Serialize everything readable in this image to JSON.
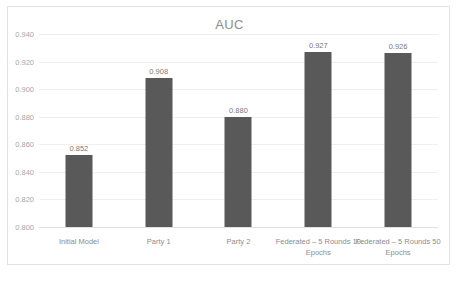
{
  "chart_data": {
    "type": "bar",
    "title": "AUC",
    "xlabel": "",
    "ylabel": "",
    "ylim": [
      0.8,
      0.94
    ],
    "ytick_step": 0.02,
    "yticks": [
      "0.940",
      "0.920",
      "0.900",
      "0.880",
      "0.860",
      "0.840",
      "0.820",
      "0.800"
    ],
    "ytick_values": [
      0.94,
      0.92,
      0.9,
      0.88,
      0.86,
      0.84,
      0.82,
      0.8
    ],
    "grid": true,
    "legend": false,
    "bar_color": "#595959",
    "categories": [
      "Initial Model",
      "Party 1",
      "Party 2",
      "Federated – 5 Rounds 10 Epochs",
      "Federated – 5 Rounds 50 Epochs"
    ],
    "values": [
      0.852,
      0.908,
      0.88,
      0.927,
      0.926
    ],
    "data_labels": [
      "0.852",
      "0.908",
      "0.880",
      "0.927",
      "0.926"
    ]
  }
}
